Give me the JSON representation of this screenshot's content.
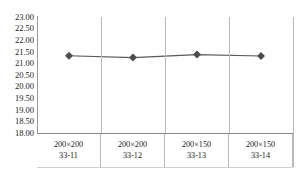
{
  "chart_data": {
    "type": "line",
    "title": "",
    "xlabel": "",
    "ylabel": "",
    "categories": [
      "200×200\n33-11",
      "200×200\n33-12",
      "200×150\n33-13",
      "200×150\n33-14"
    ],
    "category_lines": [
      {
        "line1": "200×200",
        "line2": "33-11"
      },
      {
        "line1": "200×200",
        "line2": "33-12"
      },
      {
        "line1": "200×150",
        "line2": "33-13"
      },
      {
        "line1": "200×150",
        "line2": "33-14"
      }
    ],
    "values": [
      21.33,
      21.25,
      21.38,
      21.32
    ],
    "ylim": [
      18.0,
      23.0
    ],
    "ytick_step": 0.5,
    "yticks": [
      "23.00",
      "22.50",
      "22.00",
      "21.50",
      "21.00",
      "20.50",
      "20.00",
      "19.50",
      "19.00",
      "18.50",
      "18.00"
    ],
    "grid": "vertical",
    "legend": "none",
    "series_name": "",
    "marker": "diamond",
    "colors": {
      "line": "#595959",
      "marker": "#4d4d4d",
      "gridline": "#b9b9b9",
      "axis": "#8a8a8a",
      "text": "#1a1a1a",
      "background": "#ffffff"
    }
  }
}
